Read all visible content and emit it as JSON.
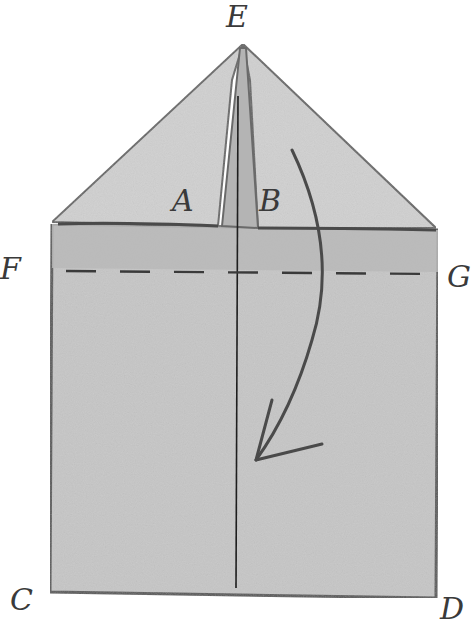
{
  "figure": {
    "type": "paper-folding-diagram",
    "points": {
      "E": "E",
      "A": "A",
      "B": "B",
      "F": "F",
      "G": "G",
      "C": "C",
      "D": "D"
    },
    "elements": {
      "triangle_flap": "Triangular flap with apex E",
      "slit": "Narrow slit between flaps A and B along center line",
      "fold_line": "Dashed fold line from F to G",
      "center_line": "Vertical center line from E to bottom edge CD",
      "arrow": "Curved arrow indicating folding the top section down"
    },
    "colors": {
      "paper_fill": "#c8c8c8",
      "paper_fill_light": "#d2d2d2",
      "band_fill": "#bdbdbd",
      "outline": "#555555",
      "ink": "#2e2e2e",
      "background": "#ffffff"
    }
  }
}
